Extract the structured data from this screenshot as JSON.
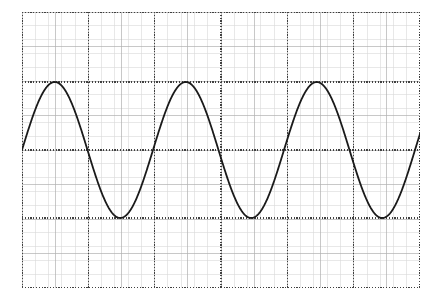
{
  "figure": {
    "title": "",
    "background_color": "#ffffff",
    "width": 442,
    "height": 303
  },
  "plot": {
    "name": "sine-waveform-plot",
    "left": 22,
    "top": 12,
    "width": 398,
    "height": 276
  },
  "grid": {
    "minor": {
      "color": "#d9d9d9",
      "spacing_x": 13.27,
      "spacing_y": 13.8,
      "width": 0.6,
      "visible": true
    },
    "medium": {
      "color": "#b0b0b0",
      "spacing_x": 33.17,
      "spacing_y": 34.5,
      "width": 0.7,
      "visible": true
    },
    "major": {
      "color": "#404040",
      "style": "dotted",
      "width": 1.2,
      "visible": true,
      "x_positions": [
        0,
        66.33,
        132.67,
        199,
        265.33,
        331.67,
        398
      ],
      "y_positions": [
        0,
        70,
        138,
        206,
        276
      ]
    }
  },
  "chart_data": {
    "type": "line",
    "title": "",
    "subtitle": "",
    "xlabel": "",
    "ylabel": "",
    "xlim": [
      0,
      3.0
    ],
    "ylim": [
      -1.5,
      1.5
    ],
    "grid": true,
    "legend_position": "none",
    "xticks": [
      0.0,
      0.5,
      1.0,
      1.5,
      2.0,
      2.5,
      3.0
    ],
    "xticklabels": [
      "",
      "",
      "",
      "",
      "",
      "",
      ""
    ],
    "yticks": [
      -1.5,
      -0.75,
      0.0,
      0.75,
      1.5
    ],
    "yticklabels": [
      "",
      "",
      "",
      "",
      ""
    ],
    "annotations": [],
    "series": [
      {
        "name": "sine",
        "color": "#1a1a1a",
        "linewidth": 1.8,
        "waveform": "sine",
        "amplitude": 1.0,
        "period_units": 1.48,
        "frequency_cycles": 3.03,
        "phase_deg": 0,
        "offset": 0,
        "peak_value": 1.0,
        "trough_value": -1.0,
        "zero_level": 0,
        "peak_x_px": [
          57,
          190,
          318
        ],
        "trough_x_px": [
          123,
          253,
          385
        ],
        "zero_crossing_x_px": [
          22,
          90,
          155,
          222,
          287,
          353,
          420
        ],
        "samples_note": "y = sin(2*pi*x/1.48)"
      }
    ]
  },
  "curve_geometry": {
    "amplitude_px": 68,
    "zero_line_px": 138,
    "period_px": 131,
    "phase_px": 0,
    "stroke_color": "#1a1a1a",
    "stroke_width": 1.8
  }
}
